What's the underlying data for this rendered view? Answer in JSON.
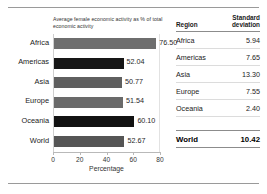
{
  "chart_data": {
    "type": "bar",
    "orientation": "horizontal",
    "title": "Average female economic activity as % of total economic activity",
    "xlabel": "Percentage",
    "ylabel": "",
    "xlim": [
      0,
      80
    ],
    "xticks": [
      0,
      20,
      40,
      60,
      80
    ],
    "grid": false,
    "legend": "none",
    "categories": [
      "Africa",
      "Americas",
      "Asia",
      "Europe",
      "Oceania",
      "World"
    ],
    "values": [
      76.5,
      52.04,
      50.77,
      51.54,
      60.1,
      52.67
    ],
    "value_labels": [
      "76.50",
      "52.04",
      "50.77",
      "51.54",
      "60.10",
      "52.67"
    ],
    "bar_colors": [
      "#6e6e6e",
      "#161616",
      "#5f5f5f",
      "#6a6a6a",
      "#121212",
      "#555555"
    ]
  },
  "table": {
    "headers": {
      "region": "Region",
      "standard_deviation": "Standard deviation"
    },
    "rows": [
      {
        "region": "Africa",
        "sd": "5.94"
      },
      {
        "region": "Americas",
        "sd": "7.65"
      },
      {
        "region": "Asia",
        "sd": "13.30"
      },
      {
        "region": "Europe",
        "sd": "7.55"
      },
      {
        "region": "Oceania",
        "sd": "2.40"
      }
    ],
    "total": {
      "region": "World",
      "sd": "10.42"
    }
  }
}
